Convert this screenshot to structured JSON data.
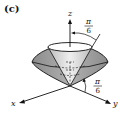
{
  "figure": {
    "panel_label": "(c)",
    "axes": {
      "z_label": "z",
      "x_label": "x",
      "y_label": "y"
    },
    "angles": {
      "upper_angle": {
        "numerator": "π",
        "denominator": "6",
        "description": "angle between z-axis and inner cone"
      },
      "lower_angle": {
        "numerator": "π",
        "denominator": "6",
        "description": "angle between xy-plane and outer cone"
      }
    },
    "solid": "region between two cones",
    "colors": {
      "outer_cone_fill": "#9a9a9a",
      "inner_cone_fill": "#d9d9d9",
      "rim_fill": "#ffffff",
      "stroke": "#111111"
    }
  }
}
